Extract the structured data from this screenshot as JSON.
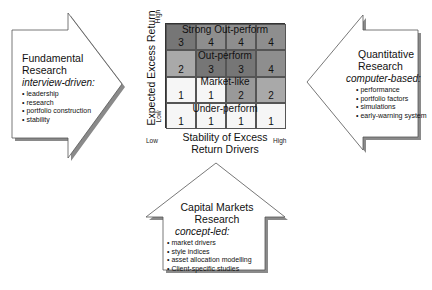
{
  "matrix": {
    "y_axis_label": "Expected Excess Return",
    "y_high": "High",
    "y_low": "Low",
    "x_axis_label_line1": "Stability of Excess",
    "x_axis_label_line2": "Return Drivers",
    "x_low": "Low",
    "x_high": "High",
    "rows": [
      {
        "label": "Strong Out-perform",
        "values": [
          "3",
          "4",
          "4",
          "4"
        ]
      },
      {
        "label": "Out-perform",
        "values": [
          "2",
          "3",
          "3",
          "4"
        ]
      },
      {
        "label": "Market-like",
        "values": [
          "1",
          "1",
          "2",
          "2"
        ]
      },
      {
        "label": "Under-perform",
        "values": [
          "1",
          "1",
          "1",
          "1"
        ]
      }
    ],
    "shade_colors": {
      "1": "#f6f6f6",
      "2": "#a9a9a9",
      "3": "#767676",
      "4": "#8e8e8e"
    }
  },
  "left_arrow": {
    "title_line1": "Fundamental",
    "title_line2": "Research",
    "subtitle": "interview-driven:",
    "items": [
      "leadership",
      "research",
      "portfolio construction",
      "stability"
    ]
  },
  "right_arrow": {
    "title_line1": "Quantitative",
    "title_line2": "Research",
    "subtitle": "computer-based:",
    "items": [
      "performance",
      "portfolio factors",
      "simulations",
      "early-warning system"
    ]
  },
  "bottom_arrow": {
    "title_line1": "Capital Markets",
    "title_line2": "Research",
    "subtitle": "concept-led:",
    "items": [
      "market drivers",
      "style indices",
      "asset allocation modelling",
      "Client-specific studies"
    ]
  }
}
